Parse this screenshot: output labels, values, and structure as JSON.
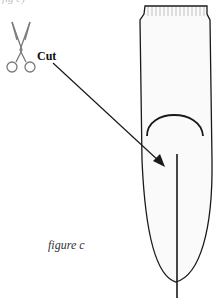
{
  "figure": {
    "top_fragment": "fig c)",
    "cut_label": "Cut",
    "caption": "figure c",
    "icons": {
      "scissors": "scissors-icon"
    },
    "colors": {
      "stroke": "#1a1a1a",
      "scissors": "#7a7a7a",
      "fill": "#fafafa",
      "caption": "#333333"
    }
  }
}
